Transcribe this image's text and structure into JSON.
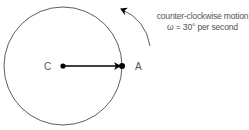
{
  "diagram": {
    "type": "circular-motion",
    "circle": {
      "cx": 63,
      "cy": 66,
      "r": 59
    },
    "center_label": "C",
    "point_label": "A",
    "annotation": {
      "line1": "counter-clockwise motion",
      "line2": "ω = 30° per second"
    },
    "colors": {
      "stroke": "#000000",
      "text": "#555555"
    }
  }
}
